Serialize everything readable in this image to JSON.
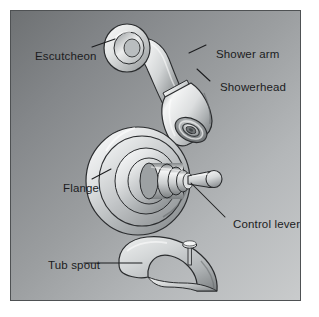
{
  "figure": {
    "panel": {
      "background_dark": "#6e7173",
      "background_light": "#c9cbcc",
      "border_color": "#4e5153"
    }
  },
  "labels": {
    "escutcheon": "Escutcheon",
    "shower_arm": "Shower arm",
    "showerhead": "Showerhead",
    "flange": "Flange",
    "control_lever": "Control lever",
    "tub_spout": "Tub spout"
  },
  "parts": [
    {
      "id": "shower-assembly",
      "name": "Shower arm and showerhead assembly",
      "components": [
        "escutcheon",
        "shower_arm",
        "showerhead"
      ]
    },
    {
      "id": "valve-assembly",
      "name": "Shower valve trim with flange and control lever",
      "components": [
        "flange",
        "control_lever"
      ]
    },
    {
      "id": "tub-spout-assembly",
      "name": "Tub spout with diverter knob",
      "components": [
        "tub_spout"
      ]
    }
  ],
  "colors": {
    "line": "#2a2c2e",
    "metal_light": "#f2f3f3",
    "metal_mid": "#c3c6c7",
    "metal_dark": "#7c8082",
    "metal_shadow": "#5c6062",
    "text": "#1b1c1e"
  }
}
